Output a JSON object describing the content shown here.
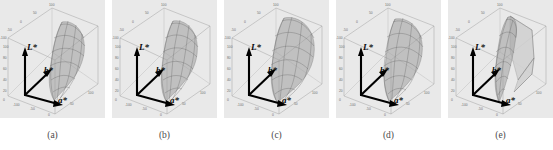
{
  "figure": {
    "kind": "multi-panel-3d-gamut-figure",
    "panel_count": 5,
    "background_color": "#e9e9e9",
    "page_color": "#ffffff"
  },
  "axes": {
    "lightness_label": "L*",
    "blue_yellow_label": "b*",
    "red_green_label": "a*",
    "tick_values": [
      "100",
      "50",
      "0",
      "-50",
      "-100"
    ],
    "top_tick": "100",
    "left_ticks": [
      "100",
      "80",
      "60",
      "40",
      "20",
      "0"
    ],
    "a_axis_ticks": [
      "-100",
      "-50",
      "0",
      "50",
      "100"
    ],
    "b_axis_ticks": [
      "-100",
      "-50",
      "0",
      "50",
      "100"
    ],
    "axis_color": "#0a0a0a",
    "box_color": "#9a9a9a",
    "tick_color": "#6e6e6e"
  },
  "panels": [
    {
      "id": "a",
      "caption": "(a)",
      "gamut_style": "smooth-mesh",
      "description": "wireframe color gamut solid in CIELAB box"
    },
    {
      "id": "b",
      "caption": "(b)",
      "gamut_style": "smooth-mesh",
      "description": "wireframe color gamut solid in CIELAB box"
    },
    {
      "id": "c",
      "caption": "(c)",
      "gamut_style": "bulky-mesh",
      "description": "wider rounded wireframe color gamut solid"
    },
    {
      "id": "d",
      "caption": "(d)",
      "gamut_style": "smooth-mesh",
      "description": "wireframe color gamut solid in CIELAB box"
    },
    {
      "id": "e",
      "caption": "(e)",
      "gamut_style": "faceted-mesh",
      "description": "angular faceted gamut with flat planar surfaces"
    }
  ],
  "colors": {
    "mesh_line": "#5f5f5f",
    "mesh_fill": "#9e9e9e",
    "facet_fill": "#cfcfcf",
    "caption_text": "#4a4a4a"
  }
}
